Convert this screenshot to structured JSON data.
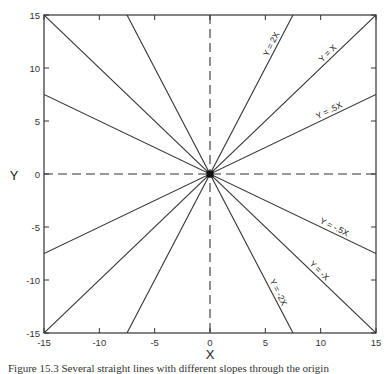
{
  "chart_data": {
    "type": "line",
    "title": "",
    "xlabel": "X",
    "ylabel": "Y",
    "xlim": [
      -15,
      15
    ],
    "ylim": [
      -15,
      15
    ],
    "xticks": [
      -15,
      -10,
      -5,
      0,
      5,
      10,
      15
    ],
    "yticks": [
      -15,
      -10,
      -5,
      0,
      5,
      10,
      15
    ],
    "grid": false,
    "reference_lines": [
      {
        "name": "x-axis",
        "style": "dashed",
        "equation": "Y = 0"
      },
      {
        "name": "y-axis",
        "style": "dashed",
        "equation": "X = 0"
      }
    ],
    "series": [
      {
        "name": "Y = 2X",
        "slope": 2,
        "x": [
          -7.5,
          7.5
        ],
        "y": [
          -15,
          15
        ],
        "labeled": true
      },
      {
        "name": "Y = X",
        "slope": 1,
        "x": [
          -15,
          15
        ],
        "y": [
          -15,
          15
        ],
        "labeled": true
      },
      {
        "name": "Y = .5X",
        "slope": 0.5,
        "x": [
          -15,
          15
        ],
        "y": [
          -7.5,
          7.5
        ],
        "labeled": true
      },
      {
        "name": "Y = -.5X",
        "slope": -0.5,
        "x": [
          -15,
          15
        ],
        "y": [
          7.5,
          -7.5
        ],
        "labeled": true
      },
      {
        "name": "Y = -X",
        "slope": -1,
        "x": [
          -15,
          15
        ],
        "y": [
          15,
          -15
        ],
        "labeled": true
      },
      {
        "name": "Y = -2X",
        "slope": -2,
        "x": [
          -7.5,
          7.5
        ],
        "y": [
          15,
          -15
        ],
        "labeled": true
      }
    ],
    "annotations": [
      {
        "text": "Y = 2X",
        "at": [
          6,
          12
        ]
      },
      {
        "text": "Y = X",
        "at": [
          11,
          11
        ]
      },
      {
        "text": "Y = .5X",
        "at": [
          11,
          5.5
        ]
      },
      {
        "text": "Y = -.5X",
        "at": [
          11,
          -5.5
        ]
      },
      {
        "text": "Y = -X",
        "at": [
          9.5,
          -9.5
        ]
      },
      {
        "text": "Y = -2X",
        "at": [
          5.7,
          -11.4
        ]
      }
    ],
    "origin_marker": "filled-square"
  },
  "labels": {
    "xlabel": "X",
    "ylabel": "Y",
    "caption": "Figure 15.3 Several straight lines with different slopes through the origin"
  }
}
